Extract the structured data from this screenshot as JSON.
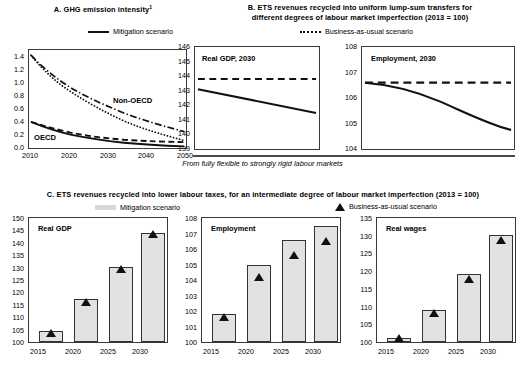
{
  "figure": {
    "width": 525,
    "height": 379,
    "background": "#ffffff",
    "accent": "#111111",
    "bar_fill": "#e2e2e2"
  },
  "panelA": {
    "title": "A. GHG emission intensity",
    "title_superscript": "1",
    "legend": [
      {
        "marker": "solid-line",
        "label": "Mitigation scenario"
      }
    ],
    "label_oecd": "OECD",
    "label_non_oecd": "Non-OECD"
  },
  "panelB": {
    "title_line1": "B. ETS revenues recycled into uniform lump-sum transfers for",
    "title_line2": "different degrees of labour market imperfection (2013 = 100)",
    "legend": [
      {
        "marker": "dotted-line",
        "label": "Business-as-usual scenario"
      }
    ],
    "caption": "From fully flexible to strongly rigid labour markets",
    "left_label": "Real GDP, 2030",
    "right_label": "Employment, 2030"
  },
  "panelC": {
    "title": "C. ETS revenues recycled into lower labour taxes, for an intermediate degree of labour market imperfection (2013 = 100)",
    "legend": [
      {
        "marker": "bar-swatch",
        "label": "Mitigation scenario"
      },
      {
        "marker": "triangle",
        "label": "Business-as-usual scenario"
      }
    ],
    "label_real_gdp": "Real GDP",
    "label_employment": "Employment",
    "label_real_wages": "Real wages"
  },
  "chart_data": [
    {
      "id": "panel-a",
      "type": "line",
      "title": "A. GHG emission intensity 1",
      "xlabel": "",
      "ylabel": "",
      "xlim": [
        2010,
        2050
      ],
      "ylim": [
        0.0,
        1.5
      ],
      "xticks": [
        2010,
        2020,
        2030,
        2040,
        2050
      ],
      "yticks": [
        0.0,
        0.2,
        0.4,
        0.6,
        0.8,
        1.0,
        1.2,
        1.4
      ],
      "grid": false,
      "legend_position": "top-center",
      "annotations": [
        "OECD",
        "Non-OECD"
      ],
      "x": [
        2010,
        2015,
        2020,
        2025,
        2030,
        2035,
        2040,
        2045,
        2050
      ],
      "series": [
        {
          "name": "Non-OECD business-as-usual",
          "style": "dash-dot",
          "values": [
            1.42,
            1.2,
            1.04,
            0.92,
            0.82,
            0.74,
            0.67,
            0.61,
            0.55
          ]
        },
        {
          "name": "Non-OECD mitigation",
          "style": "dotted",
          "values": [
            1.42,
            1.17,
            0.98,
            0.84,
            0.73,
            0.64,
            0.56,
            0.49,
            0.42
          ]
        },
        {
          "name": "OECD business-as-usual",
          "style": "dashed",
          "values": [
            0.4,
            0.355,
            0.32,
            0.29,
            0.265,
            0.245,
            0.23,
            0.22,
            0.21
          ]
        },
        {
          "name": "OECD mitigation",
          "style": "solid",
          "values": [
            0.4,
            0.34,
            0.29,
            0.25,
            0.21,
            0.175,
            0.145,
            0.115,
            0.085
          ]
        }
      ]
    },
    {
      "id": "panel-b-real-gdp",
      "type": "line",
      "title": "Real GDP, 2030",
      "xlabel": "From fully flexible to strongly rigid labour markets",
      "ylabel": "",
      "ylim": [
        139,
        146
      ],
      "yticks": [
        139,
        140,
        141,
        142,
        143,
        144,
        145,
        146
      ],
      "xticks": [],
      "grid": false,
      "x": [
        0,
        1,
        2,
        3,
        4,
        5,
        6
      ],
      "series": [
        {
          "name": "Business-as-usual scenario",
          "style": "dashed",
          "values": [
            143.8,
            143.8,
            143.8,
            143.8,
            143.8,
            143.8,
            143.8
          ]
        },
        {
          "name": "Mitigation scenario",
          "style": "solid",
          "values": [
            143.1,
            142.85,
            142.6,
            142.35,
            142.1,
            141.8,
            141.5
          ]
        }
      ]
    },
    {
      "id": "panel-b-employment",
      "type": "line",
      "title": "Employment, 2030",
      "xlabel": "From fully flexible to strongly rigid labour markets",
      "ylabel": "",
      "ylim": [
        104,
        108
      ],
      "yticks": [
        104,
        105,
        106,
        107,
        108
      ],
      "xticks": [],
      "grid": false,
      "x": [
        0,
        1,
        2,
        3,
        4,
        5,
        6
      ],
      "series": [
        {
          "name": "Business-as-usual scenario",
          "style": "dashed",
          "values": [
            106.6,
            106.6,
            106.6,
            106.6,
            106.6,
            106.6,
            106.6
          ]
        },
        {
          "name": "Mitigation scenario",
          "style": "solid",
          "values": [
            106.6,
            106.45,
            106.2,
            105.85,
            105.5,
            105.1,
            104.75
          ]
        }
      ]
    },
    {
      "id": "panel-c-real-gdp",
      "type": "bar",
      "title": "Real GDP",
      "categories": [
        "2015",
        "2020",
        "2025",
        "2030"
      ],
      "ylim": [
        100,
        150
      ],
      "yticks": [
        100,
        105,
        110,
        115,
        120,
        125,
        130,
        135,
        140,
        145,
        150
      ],
      "grid": false,
      "series": [
        {
          "name": "Mitigation scenario",
          "style": "bar",
          "values": [
            104.6,
            117.2,
            130.3,
            144.0
          ]
        },
        {
          "name": "Business-as-usual scenario",
          "style": "triangle",
          "values": [
            104.2,
            116.7,
            129.9,
            143.9
          ]
        }
      ]
    },
    {
      "id": "panel-c-employment",
      "type": "bar",
      "title": "Employment",
      "categories": [
        "2015",
        "2020",
        "2025",
        "2030"
      ],
      "ylim": [
        100,
        108
      ],
      "yticks": [
        100,
        101,
        102,
        103,
        104,
        105,
        106,
        107,
        108
      ],
      "grid": false,
      "series": [
        {
          "name": "Mitigation scenario",
          "style": "bar",
          "values": [
            101.8,
            104.95,
            106.6,
            107.5
          ]
        },
        {
          "name": "Business-as-usual scenario",
          "style": "triangle",
          "values": [
            101.65,
            104.25,
            105.65,
            106.6
          ]
        }
      ]
    },
    {
      "id": "panel-c-real-wages",
      "type": "bar",
      "title": "Real wages",
      "categories": [
        "2015",
        "2020",
        "2025",
        "2030"
      ],
      "ylim": [
        100,
        135
      ],
      "yticks": [
        100,
        105,
        110,
        115,
        120,
        125,
        130,
        135
      ],
      "grid": false,
      "series": [
        {
          "name": "Mitigation scenario",
          "style": "bar",
          "values": [
            101.1,
            109.0,
            119.2,
            130.1
          ]
        },
        {
          "name": "Business-as-usual scenario",
          "style": "triangle",
          "values": [
            100.6,
            108.5,
            118.0,
            129.2
          ]
        }
      ]
    }
  ]
}
